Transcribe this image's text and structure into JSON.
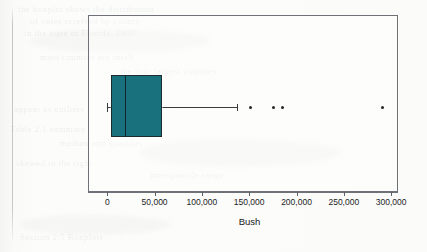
{
  "page": {
    "background_color": "#fbfbfa",
    "bleed_through_text": [
      {
        "text": "the boxplot shows the distribution",
        "x": 18,
        "y": 4
      },
      {
        "text": "of votes received by county",
        "x": 30,
        "y": 16
      },
      {
        "text": "in the state of Florida, 2000",
        "x": 24,
        "y": 28
      },
      {
        "text": "most counties are small",
        "x": 40,
        "y": 52
      },
      {
        "text": "the four largest counties",
        "x": 120,
        "y": 66
      },
      {
        "text": "appear as outliers",
        "x": 14,
        "y": 104
      },
      {
        "text": "Table 2.1 summary",
        "x": 10,
        "y": 124
      },
      {
        "text": "median and quartiles",
        "x": 60,
        "y": 138
      },
      {
        "text": "skewed to the right",
        "x": 16,
        "y": 158
      },
      {
        "text": "interquartile range",
        "x": 150,
        "y": 170
      },
      {
        "text": "Section 2.5 Boxplots",
        "x": 20,
        "y": 232
      }
    ]
  },
  "figure": {
    "frame": {
      "color": "#6e7176"
    },
    "box_color": "#18717c",
    "line_color": "#3a3c3f",
    "outlier_color": "#232528"
  },
  "chart_data": {
    "type": "box",
    "title": "",
    "xlabel": "Bush",
    "ylabel": "",
    "orientation": "horizontal",
    "xlim": [
      -20000,
      307000
    ],
    "grid": false,
    "legend": null,
    "xticks": [
      0,
      50000,
      100000,
      150000,
      200000,
      250000,
      300000
    ],
    "xticklabels": [
      "0",
      "50,000",
      "100,000",
      "150,000",
      "200,000",
      "250,000",
      "300,000"
    ],
    "boxes": [
      {
        "name": "Bush",
        "whisker_low": 0,
        "q1": 4000,
        "median": 19000,
        "q3": 58000,
        "whisker_high": 137000,
        "outliers": [
          151000,
          176000,
          185000,
          291000
        ]
      }
    ]
  }
}
